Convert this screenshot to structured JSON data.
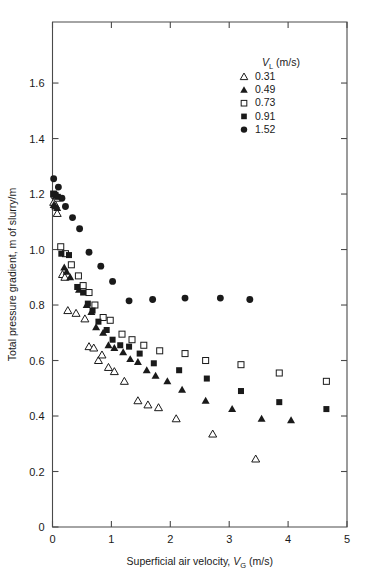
{
  "chart_data": {
    "type": "scatter",
    "title": "",
    "xlabel": "Superficial air velocity, V_G (m/s)",
    "ylabel": "Total pressure gradient, m of slurry/m",
    "xlim": [
      0,
      5
    ],
    "ylim": [
      0,
      1.82
    ],
    "xticks": [
      0,
      1,
      2,
      3,
      4,
      5
    ],
    "xticklabels": [
      "0",
      "1",
      "2",
      "3",
      "4",
      "5"
    ],
    "yticks": [
      0,
      0.2,
      0.4,
      0.6,
      0.8,
      1.0,
      1.2,
      1.4,
      1.6
    ],
    "yticklabels": [
      "0",
      "0.2",
      "0.4",
      "0.6",
      "0.8",
      "1.0",
      "1.2",
      "1.4",
      "1.6"
    ],
    "grid": false,
    "legend_position": "top-right",
    "legend_title": "V_L (m/s)",
    "series": [
      {
        "name": "0.31",
        "marker": "open-triangle",
        "points": [
          [
            0.02,
            1.17
          ],
          [
            0.05,
            1.16
          ],
          [
            0.08,
            1.13
          ],
          [
            0.17,
            0.91
          ],
          [
            0.21,
            0.9
          ],
          [
            0.26,
            0.78
          ],
          [
            0.4,
            0.77
          ],
          [
            0.55,
            0.75
          ],
          [
            0.62,
            0.65
          ],
          [
            0.7,
            0.645
          ],
          [
            0.78,
            0.6
          ],
          [
            0.84,
            0.62
          ],
          [
            0.95,
            0.575
          ],
          [
            1.05,
            0.56
          ],
          [
            1.22,
            0.525
          ],
          [
            1.45,
            0.455
          ],
          [
            1.62,
            0.44
          ],
          [
            1.8,
            0.43
          ],
          [
            2.1,
            0.39
          ],
          [
            2.72,
            0.335
          ],
          [
            3.45,
            0.245
          ]
        ]
      },
      {
        "name": "0.49",
        "marker": "filled-triangle",
        "points": [
          [
            0.02,
            1.16
          ],
          [
            0.05,
            1.155
          ],
          [
            0.08,
            1.15
          ],
          [
            0.2,
            0.935
          ],
          [
            0.24,
            0.92
          ],
          [
            0.3,
            0.9
          ],
          [
            0.45,
            0.855
          ],
          [
            0.58,
            0.8
          ],
          [
            0.66,
            0.775
          ],
          [
            0.74,
            0.72
          ],
          [
            0.86,
            0.7
          ],
          [
            0.95,
            0.655
          ],
          [
            1.05,
            0.645
          ],
          [
            1.2,
            0.63
          ],
          [
            1.32,
            0.605
          ],
          [
            1.45,
            0.595
          ],
          [
            1.6,
            0.565
          ],
          [
            1.75,
            0.545
          ],
          [
            1.95,
            0.525
          ],
          [
            2.2,
            0.495
          ],
          [
            2.6,
            0.455
          ],
          [
            3.05,
            0.425
          ],
          [
            3.55,
            0.39
          ],
          [
            4.05,
            0.385
          ]
        ]
      },
      {
        "name": "0.73",
        "marker": "open-square",
        "points": [
          [
            0.02,
            1.2
          ],
          [
            0.04,
            1.195
          ],
          [
            0.08,
            1.185
          ],
          [
            0.14,
            1.01
          ],
          [
            0.22,
            0.985
          ],
          [
            0.32,
            0.945
          ],
          [
            0.44,
            0.905
          ],
          [
            0.52,
            0.87
          ],
          [
            0.62,
            0.845
          ],
          [
            0.72,
            0.8
          ],
          [
            0.86,
            0.755
          ],
          [
            0.98,
            0.745
          ],
          [
            1.18,
            0.695
          ],
          [
            1.35,
            0.675
          ],
          [
            1.55,
            0.655
          ],
          [
            1.82,
            0.635
          ],
          [
            2.25,
            0.625
          ],
          [
            2.6,
            0.6
          ],
          [
            3.2,
            0.585
          ],
          [
            3.85,
            0.555
          ],
          [
            4.65,
            0.525
          ]
        ]
      },
      {
        "name": "0.91",
        "marker": "filled-square",
        "points": [
          [
            0.02,
            1.2
          ],
          [
            0.05,
            1.195
          ],
          [
            0.09,
            1.19
          ],
          [
            0.15,
            0.985
          ],
          [
            0.28,
            0.98
          ],
          [
            0.42,
            0.865
          ],
          [
            0.52,
            0.845
          ],
          [
            0.6,
            0.805
          ],
          [
            0.68,
            0.78
          ],
          [
            0.78,
            0.74
          ],
          [
            0.92,
            0.71
          ],
          [
            1.02,
            0.675
          ],
          [
            1.15,
            0.655
          ],
          [
            1.3,
            0.65
          ],
          [
            1.48,
            0.625
          ],
          [
            1.72,
            0.59
          ],
          [
            2.15,
            0.565
          ],
          [
            2.62,
            0.535
          ],
          [
            3.2,
            0.49
          ],
          [
            3.85,
            0.45
          ],
          [
            4.65,
            0.425
          ]
        ]
      },
      {
        "name": "1.52",
        "marker": "filled-circle",
        "points": [
          [
            0.02,
            1.255
          ],
          [
            0.1,
            1.225
          ],
          [
            0.16,
            1.185
          ],
          [
            0.22,
            1.155
          ],
          [
            0.34,
            1.115
          ],
          [
            0.46,
            1.075
          ],
          [
            0.62,
            0.99
          ],
          [
            0.82,
            0.94
          ],
          [
            1.02,
            0.885
          ],
          [
            1.3,
            0.815
          ],
          [
            1.7,
            0.82
          ],
          [
            2.25,
            0.825
          ],
          [
            2.85,
            0.825
          ],
          [
            3.35,
            0.82
          ]
        ]
      }
    ]
  },
  "axes": {
    "x_label_main": "Superficial air velocity, ",
    "x_label_var": "V",
    "x_label_sub": "G",
    "x_label_units": " (m/s)",
    "y_label": "Total pressure gradient, m of slurry/m"
  },
  "legend": {
    "title_var": "V",
    "title_sub": "L",
    "title_units": " (m/s)",
    "entries": [
      {
        "label": "0.31",
        "marker": "open-triangle"
      },
      {
        "label": "0.49",
        "marker": "filled-triangle"
      },
      {
        "label": "0.73",
        "marker": "open-square"
      },
      {
        "label": "0.91",
        "marker": "filled-square"
      },
      {
        "label": "1.52",
        "marker": "filled-circle"
      }
    ]
  },
  "colors": {
    "marker": "#1a1a1a",
    "axis": "#4a4a4a",
    "background": "#ffffff"
  }
}
